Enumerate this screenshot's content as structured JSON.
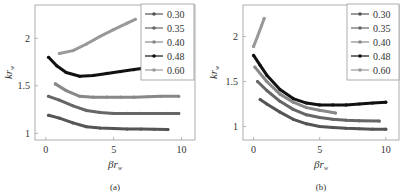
{
  "chart_data": [
    {
      "type": "line",
      "panel_label": "(a)",
      "title": "",
      "xlabel": "βr_w",
      "ylabel": "kr_w",
      "xlim": [
        -0.8,
        11
      ],
      "ylim": [
        0.93,
        2.35
      ],
      "xticks": [
        0,
        5,
        10
      ],
      "yticks": [
        1,
        1.5,
        2
      ],
      "ytick_labels": [
        "1",
        "1.5",
        "2"
      ],
      "xtick_labels": [
        "0",
        "5",
        "10"
      ],
      "grid": false,
      "legend_position": "upper right",
      "series": [
        {
          "name": "0.30",
          "color": "#555555",
          "marker": "dot",
          "x": [
            0.2,
            1,
            2,
            3,
            4,
            5,
            6,
            7,
            8,
            9
          ],
          "y": [
            1.19,
            1.16,
            1.11,
            1.07,
            1.055,
            1.05,
            1.045,
            1.045,
            1.043,
            1.04
          ]
        },
        {
          "name": "0.35",
          "color": "#666666",
          "marker": "dot",
          "x": [
            0.2,
            1,
            2,
            3,
            4,
            5,
            6,
            7,
            8,
            9,
            9.8
          ],
          "y": [
            1.39,
            1.35,
            1.29,
            1.24,
            1.22,
            1.21,
            1.21,
            1.21,
            1.21,
            1.21,
            1.21
          ]
        },
        {
          "name": "0.40",
          "color": "#888888",
          "marker": "plus",
          "x": [
            0.7,
            1.5,
            2.5,
            3.5,
            4.5,
            5.5,
            6.5,
            7.5,
            8.5,
            9.8
          ],
          "y": [
            1.52,
            1.45,
            1.39,
            1.38,
            1.38,
            1.38,
            1.38,
            1.385,
            1.39,
            1.39
          ]
        },
        {
          "name": "0.48",
          "color": "#111111",
          "marker": "dot",
          "x": [
            0.2,
            0.8,
            1.5,
            2.5,
            3.5,
            4.5,
            5.5,
            6.5,
            7.5
          ],
          "y": [
            1.8,
            1.71,
            1.64,
            1.6,
            1.61,
            1.63,
            1.65,
            1.67,
            1.69
          ]
        },
        {
          "name": "0.60",
          "color": "#999999",
          "marker": "dot",
          "x": [
            1.0,
            2.0,
            3.0,
            4.0,
            5.0,
            6.0,
            6.6
          ],
          "y": [
            1.84,
            1.87,
            1.94,
            2.02,
            2.09,
            2.16,
            2.2
          ]
        }
      ]
    },
    {
      "type": "line",
      "panel_label": "(b)",
      "title": "",
      "xlabel": "βr_w",
      "ylabel": "kr_w",
      "xlim": [
        -0.8,
        11
      ],
      "ylim": [
        0.85,
        2.35
      ],
      "xticks": [
        0,
        5,
        10
      ],
      "yticks": [
        1,
        1.5,
        2
      ],
      "ytick_labels": [
        "1",
        "1.5",
        "2"
      ],
      "xtick_labels": [
        "0",
        "5",
        "10"
      ],
      "grid": false,
      "legend_position": "upper right",
      "series": [
        {
          "name": "0.30",
          "color": "#555555",
          "marker": "dot",
          "x": [
            0.5,
            1,
            2,
            3,
            4,
            5,
            6,
            7,
            8,
            9,
            10
          ],
          "y": [
            1.3,
            1.25,
            1.16,
            1.08,
            1.03,
            1.0,
            0.99,
            0.98,
            0.975,
            0.97,
            0.97
          ]
        },
        {
          "name": "0.35",
          "color": "#666666",
          "marker": "dot",
          "x": [
            0.3,
            1,
            2,
            3,
            4,
            5,
            6,
            7,
            8,
            9.5
          ],
          "y": [
            1.5,
            1.4,
            1.28,
            1.19,
            1.13,
            1.1,
            1.08,
            1.07,
            1.065,
            1.06
          ]
        },
        {
          "name": "0.40",
          "color": "#888888",
          "marker": "plus",
          "x": [
            0.1,
            1,
            2,
            3,
            4,
            5,
            6.2
          ],
          "y": [
            1.66,
            1.5,
            1.36,
            1.27,
            1.21,
            1.18,
            1.15
          ]
        },
        {
          "name": "0.48",
          "color": "#111111",
          "marker": "dot",
          "x": [
            0.0,
            0.5,
            1,
            2,
            3,
            4,
            5,
            6,
            7,
            8,
            9,
            10
          ],
          "y": [
            1.79,
            1.68,
            1.57,
            1.41,
            1.31,
            1.26,
            1.24,
            1.24,
            1.24,
            1.25,
            1.26,
            1.27
          ]
        },
        {
          "name": "0.60",
          "color": "#999999",
          "marker": "dot",
          "x": [
            0.0,
            0.3,
            0.6,
            0.8
          ],
          "y": [
            1.89,
            2.0,
            2.12,
            2.2
          ]
        }
      ]
    }
  ]
}
